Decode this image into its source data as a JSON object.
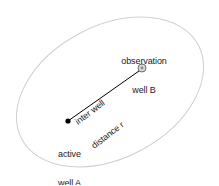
{
  "figure": {
    "background_color": "#ffffff"
  },
  "boundary": {
    "name": "aquifer-boundary-ellipse",
    "shape": "ellipse",
    "stroke_color": "#cfcfcf",
    "stroke_width": 1,
    "fill": "none",
    "center_x": 110,
    "center_y": 92,
    "radius_x": 100,
    "radius_y": 66,
    "rotation_deg": -28
  },
  "wells": {
    "active": {
      "marker_name": "active-well-marker",
      "marker_type": "filled-dot",
      "marker_color": "#000000",
      "x": 68,
      "y": 121,
      "radius": 2.6,
      "label_line1": "active",
      "label_line2": "well A"
    },
    "observation": {
      "marker_name": "observation-well-marker",
      "marker_type": "circle-with-center-dot",
      "marker_color": "#6e6e6e",
      "marker_fill": "#d9d9d9",
      "x": 142,
      "y": 68,
      "radius": 4,
      "inner_radius": 1.4,
      "label_line1": "observation",
      "label_line2": "well B"
    }
  },
  "connector": {
    "name": "inter-well-distance-line",
    "stroke_color": "#000000",
    "stroke_width": 1,
    "x1": 68,
    "y1": 121,
    "x2": 139,
    "y2": 71,
    "label_line1": "inter well",
    "label_line2": "distance r",
    "label_rotation_deg": -37.5
  }
}
